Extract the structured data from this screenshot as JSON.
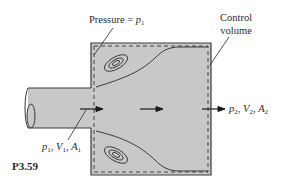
{
  "figure": {
    "id_label": "P3.59",
    "fill_color": "#c8c8c8",
    "line_color": "#3a3a3a"
  },
  "labels": {
    "pressure": {
      "text": "Pressure = ",
      "var": "p",
      "sub": "1"
    },
    "control_volume": {
      "line1": "Control",
      "line2": "volume"
    },
    "inlet": {
      "p": "p",
      "p_sub": "1",
      "V": "V",
      "V_sub": "1",
      "A": "A",
      "A_sub": "1"
    },
    "outlet": {
      "p": "p",
      "p_sub": "2",
      "V": "V",
      "V_sub": "2",
      "A": "A",
      "A_sub": "2"
    }
  }
}
